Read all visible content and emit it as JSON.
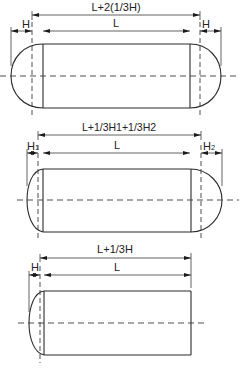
{
  "diagrams": [
    {
      "id": "two-equal-heads",
      "overall_label": "L+2(1/3H)",
      "length_label": "L",
      "left_head_label": "H",
      "right_head_label": "H"
    },
    {
      "id": "two-unequal-heads",
      "overall_label": "L+1/3H1+1/3H2",
      "length_label": "L",
      "left_head_label": "H",
      "left_head_sub": "1",
      "right_head_label": "H",
      "right_head_sub": "2"
    },
    {
      "id": "one-head",
      "overall_label": "L+1/3H",
      "length_label": "L",
      "left_head_label": "H"
    }
  ]
}
